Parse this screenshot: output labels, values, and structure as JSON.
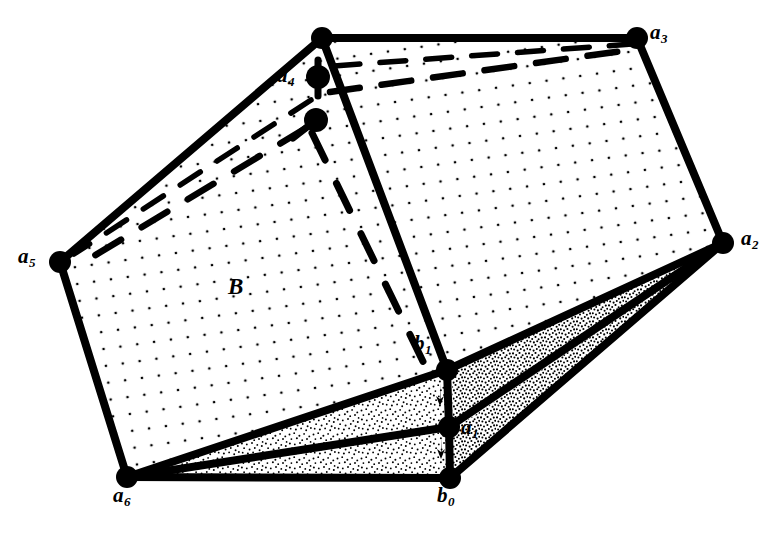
{
  "figure": {
    "background_color": "#ffffff",
    "stroke_color": "#000000",
    "width": 780,
    "height": 537
  },
  "labels": {
    "region_b": "B",
    "a1": "a",
    "a1_sub": "1",
    "a2": "a",
    "a2_sub": "2",
    "a3": "a",
    "a3_sub": "3",
    "a4": "a",
    "a4_sub": "4",
    "a5": "a",
    "a5_sub": "5",
    "a6": "a",
    "a6_sub": "6",
    "b0": "b",
    "b0_sub": "0",
    "b1": "b",
    "b1_sub": "1"
  },
  "label_positions": {
    "region_b": {
      "x": 234,
      "y": 287
    },
    "a4": {
      "x": 281,
      "y": 73
    },
    "a3": {
      "x": 648,
      "y": 27
    },
    "a2": {
      "x": 741,
      "y": 234
    },
    "a5": {
      "x": 20,
      "y": 250
    },
    "a6": {
      "x": 115,
      "y": 487
    },
    "b1": {
      "x": 416,
      "y": 339
    },
    "a1": {
      "x": 463,
      "y": 420
    },
    "b0": {
      "x": 440,
      "y": 487
    }
  },
  "vertices": {
    "top": {
      "x": 322,
      "y": 38,
      "r": 11,
      "name": "apex-vertex"
    },
    "a3": {
      "x": 637,
      "y": 38,
      "r": 11,
      "name": "vertex-a3"
    },
    "a2": {
      "x": 723,
      "y": 243,
      "r": 11,
      "name": "vertex-a2"
    },
    "a5": {
      "x": 60,
      "y": 262,
      "r": 11,
      "name": "vertex-a5"
    },
    "a6": {
      "x": 127,
      "y": 477,
      "r": 11,
      "name": "vertex-a6"
    },
    "b1": {
      "x": 447,
      "y": 370,
      "r": 11,
      "name": "vertex-b1"
    },
    "a1": {
      "x": 449,
      "y": 427,
      "r": 11,
      "name": "vertex-a1"
    },
    "b0": {
      "x": 450,
      "y": 478,
      "r": 11,
      "name": "vertex-b0"
    },
    "a4": {
      "x": 318,
      "y": 77,
      "r": 12,
      "name": "vertex-a4"
    },
    "inner": {
      "x": 316,
      "y": 120,
      "r": 12,
      "name": "vertex-inner"
    }
  },
  "faces": {
    "left_face": {
      "points": "322,38 60,262 127,477 447,370",
      "fill": "sparse-dot",
      "name": "face-B-left"
    },
    "right_face": {
      "points": "322,38 637,38 723,243 447,370",
      "fill": "sparse-dot",
      "name": "face-right"
    },
    "sliver_upper_left": {
      "points": "127,477 447,370 449,427",
      "fill": "medium-stipple",
      "name": "sliver-a6-b1-a1"
    },
    "sliver_lower_left": {
      "points": "127,477 449,427 450,478",
      "fill": "medium-stipple",
      "name": "sliver-a6-a1-b0"
    },
    "sliver_upper_right": {
      "points": "447,370 723,243 449,427",
      "fill": "dense-stipple",
      "name": "sliver-b1-a2-a1"
    },
    "sliver_lower_right": {
      "points": "449,427 723,243 450,478",
      "fill": "dense-stipple",
      "name": "sliver-a1-a2-b0"
    }
  },
  "solid_edges": [
    {
      "from": "top",
      "to": "a3",
      "name": "edge-top-a3"
    },
    {
      "from": "a3",
      "to": "a2",
      "name": "edge-a3-a2"
    },
    {
      "from": "a2",
      "to": "b1",
      "name": "edge-a2-b1"
    },
    {
      "from": "top",
      "to": "a5",
      "name": "edge-top-a5"
    },
    {
      "from": "a5",
      "to": "a6",
      "name": "edge-a5-a6"
    },
    {
      "from": "a6",
      "to": "b1",
      "name": "edge-a6-b1"
    },
    {
      "from": "top",
      "to": "b1",
      "name": "edge-top-b1"
    },
    {
      "from": "a6",
      "to": "a1",
      "name": "edge-a6-a1"
    },
    {
      "from": "a6",
      "to": "b0",
      "name": "edge-a6-b0"
    },
    {
      "from": "b1",
      "to": "a1",
      "name": "edge-b1-a1"
    },
    {
      "from": "a1",
      "to": "b0",
      "name": "edge-a1-b0"
    },
    {
      "from": "a2",
      "to": "a1",
      "name": "edge-a2-a1"
    },
    {
      "from": "a2",
      "to": "b0",
      "name": "edge-a2-b0"
    }
  ],
  "dashed_edges": [
    {
      "x1": 330,
      "y1": 70,
      "x2": 632,
      "y2": 44,
      "name": "dashed-a4-a3-upper"
    },
    {
      "x1": 328,
      "y1": 93,
      "x2": 628,
      "y2": 52,
      "name": "dashed-a4-a3-lower"
    },
    {
      "x1": 312,
      "y1": 103,
      "x2": 76,
      "y2": 255,
      "name": "dashed-a4-a5-upper"
    },
    {
      "x1": 308,
      "y1": 127,
      "x2": 84,
      "y2": 261,
      "name": "dashed-inner-a5-lower"
    },
    {
      "x1": 313,
      "y1": 132,
      "x2": 430,
      "y2": 377,
      "name": "dashed-inner-b1"
    }
  ],
  "stubs": [
    {
      "x1": 318,
      "y1": 62,
      "x2": 318,
      "y2": 94,
      "name": "stub-a4-vertical"
    },
    {
      "x1": 316,
      "y1": 120,
      "x2": 296,
      "y2": 136,
      "name": "stub-inner-diagonal"
    }
  ],
  "arrows": [
    {
      "x": 447,
      "y": 395,
      "dir": "down",
      "name": "arrow-b1-a1-down"
    },
    {
      "x": 448,
      "y": 448,
      "dir": "down",
      "name": "arrow-a1-b0-down"
    }
  ]
}
